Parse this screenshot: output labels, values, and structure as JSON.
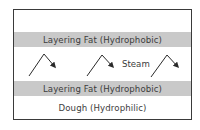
{
  "diagram": {
    "layers": [
      {
        "id": "top-space",
        "label": ""
      },
      {
        "id": "layering-fat-top",
        "label": "Layering Fat (Hydrophobic)",
        "fill": "#c9c9c9"
      },
      {
        "id": "steam-gap",
        "label": "Steam"
      },
      {
        "id": "layering-fat-bottom",
        "label": "Layering Fat (Hydrophobic)",
        "fill": "#c9c9c9"
      },
      {
        "id": "dough",
        "label": "Dough (Hydrophilic)"
      }
    ],
    "arrows": [
      {
        "id": "steam-arrow-1",
        "points": [
          [
            29,
            76
          ],
          [
            44,
            54
          ],
          [
            55,
            67
          ]
        ]
      },
      {
        "id": "steam-arrow-2",
        "points": [
          [
            87,
            76
          ],
          [
            102,
            55
          ],
          [
            113,
            67
          ]
        ]
      },
      {
        "id": "steam-arrow-3",
        "points": [
          [
            151,
            77
          ],
          [
            167,
            55
          ],
          [
            178,
            67
          ]
        ]
      }
    ],
    "colors": {
      "border": "#3a3a3a",
      "fat_band": "#c9c9c9",
      "text": "#3c3c3c",
      "arrow": "#2a2a2a"
    }
  }
}
